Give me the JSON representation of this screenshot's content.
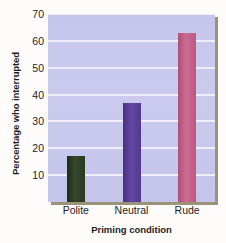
{
  "chart_data": {
    "type": "bar",
    "title": "",
    "categories": [
      "Polite",
      "Neutral",
      "Rude"
    ],
    "values": [
      17,
      37,
      63
    ],
    "series": [
      {
        "name": "Percentage who interrupted",
        "values": [
          17,
          37,
          63
        ]
      }
    ],
    "xlabel": "Priming condition",
    "ylabel": "Percentage who interrupted",
    "ylim": [
      0,
      70
    ],
    "yticks": [
      10,
      20,
      30,
      40,
      50,
      60,
      70
    ],
    "ytick_labels": [
      "10",
      "20",
      "30",
      "40",
      "50",
      "60",
      "70"
    ],
    "grid": true,
    "grid_axis": "y",
    "legend": false,
    "bar_colors": [
      "#2b3a20",
      "#523a8f",
      "#bc5881"
    ],
    "plot_background": "#c8c7ed",
    "gridline_color": "#f2f1fb"
  }
}
